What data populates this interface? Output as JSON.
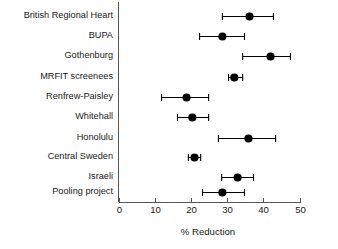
{
  "chart_data": {
    "type": "scatter",
    "title": "",
    "subtitle": "",
    "xlabel": "% Reduction",
    "ylabel": "",
    "xlim": [
      0,
      50
    ],
    "xticks": [
      0,
      10,
      20,
      30,
      40,
      50
    ],
    "xticklabels": [
      "0",
      "10",
      "20",
      "30",
      "40",
      "50"
    ],
    "grid": false,
    "legend": null,
    "orientation": "horizontal",
    "marker": "filled-circle",
    "error_bars": "horizontal-95ci",
    "categories": [
      "British Regional Heart",
      "BUPA",
      "Gothenburg",
      "MRFIT screenees",
      "Renfrew-Paisley",
      "Whitehall",
      "Honolulu",
      "Central Sweden",
      "Israeli",
      "Pooling project"
    ],
    "values": [
      36.2,
      28.7,
      42.0,
      32.0,
      18.8,
      20.4,
      35.9,
      21.0,
      32.9,
      28.7
    ],
    "lower": [
      28.7,
      22.4,
      34.3,
      30.4,
      11.9,
      16.3,
      27.6,
      19.3,
      28.5,
      23.2
    ],
    "upper": [
      42.8,
      34.8,
      47.5,
      34.3,
      24.9,
      24.9,
      43.4,
      22.7,
      37.3,
      34.8
    ],
    "points": [
      {
        "label": "British Regional Heart",
        "value": 36.2,
        "lower": 28.7,
        "upper": 42.8
      },
      {
        "label": "BUPA",
        "value": 28.7,
        "lower": 22.4,
        "upper": 34.8
      },
      {
        "label": "Gothenburg",
        "value": 42.0,
        "lower": 34.3,
        "upper": 47.5
      },
      {
        "label": "MRFIT screenees",
        "value": 32.0,
        "lower": 30.4,
        "upper": 34.3
      },
      {
        "label": "Renfrew-Paisley",
        "value": 18.8,
        "lower": 11.9,
        "upper": 24.9
      },
      {
        "label": "Whitehall",
        "value": 20.4,
        "lower": 16.3,
        "upper": 24.9
      },
      {
        "label": "Honolulu",
        "value": 35.9,
        "lower": 27.6,
        "upper": 43.4
      },
      {
        "label": "Central Sweden",
        "value": 21.0,
        "lower": 19.3,
        "upper": 22.7
      },
      {
        "label": "Israeli",
        "value": 32.9,
        "lower": 28.5,
        "upper": 37.3
      },
      {
        "label": "Pooling project",
        "value": 28.7,
        "lower": 23.2,
        "upper": 34.8
      }
    ],
    "colors": {
      "marker": "#000000",
      "error_bar": "#000000",
      "axis": "#555555",
      "text": "#1a1a1a",
      "background": "#ffffff"
    }
  }
}
